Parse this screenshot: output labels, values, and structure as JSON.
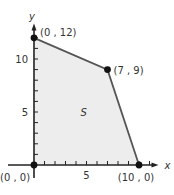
{
  "chart_data": {
    "type": "scatter",
    "title": "",
    "xlabel": "x",
    "ylabel": "y",
    "xlim": [
      0,
      11
    ],
    "ylim": [
      0,
      12.5
    ],
    "x_ticks": [
      0,
      1,
      2,
      3,
      4,
      5,
      6,
      7,
      8,
      9,
      10,
      11
    ],
    "y_ticks": [
      0,
      1,
      2,
      3,
      4,
      5,
      6,
      7,
      8,
      9,
      10,
      11,
      12
    ],
    "x_tick_labels": [
      {
        "value": 5,
        "label": "5"
      }
    ],
    "y_tick_labels": [
      {
        "value": 5,
        "label": "5"
      },
      {
        "value": 10,
        "label": "10"
      }
    ],
    "region": {
      "label": "S",
      "vertices": [
        [
          0,
          0
        ],
        [
          0,
          12
        ],
        [
          7,
          9
        ],
        [
          10,
          0
        ]
      ],
      "fill": "#ededed",
      "stroke": "#555555"
    },
    "points": [
      {
        "x": 0,
        "y": 0,
        "label": "(0 , 0)"
      },
      {
        "x": 0,
        "y": 12,
        "label": "(0 , 12)"
      },
      {
        "x": 7,
        "y": 9,
        "label": "(7 , 9)"
      },
      {
        "x": 10,
        "y": 0,
        "label": "(10 , 0)"
      }
    ],
    "region_label_position": [
      5,
      5
    ],
    "grid": false,
    "legend": "none"
  }
}
